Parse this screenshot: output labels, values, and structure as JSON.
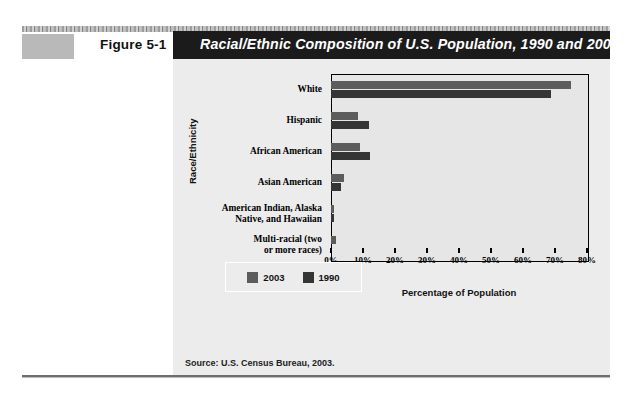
{
  "figure": {
    "label": "Figure 5-1",
    "title": "Racial/Ethnic Composition of U.S. Population, 1990 and 2003",
    "source": "Source: U.S. Census Bureau, 2003."
  },
  "colors": {
    "title_bar_bg": "#1b1b1b",
    "title_text": "#ffffff",
    "panel_bg": "#ececec",
    "plot_bg": "#e6e6e6",
    "series_2003": "#5c5c5c",
    "series_1990": "#353535",
    "figure_swatch": "#b9b9b9"
  },
  "chart_data": {
    "type": "bar",
    "orientation": "horizontal",
    "title": "Racial/Ethnic Composition of U.S. Population, 1990 and 2003",
    "xlabel": "Percentage of Population",
    "ylabel": "Race/Ethnicity",
    "xlim": [
      0,
      80
    ],
    "xticks": [
      0,
      10,
      20,
      30,
      40,
      50,
      60,
      70,
      80
    ],
    "xtick_labels": [
      "0%",
      "10%",
      "20%",
      "30%",
      "40%",
      "50%",
      "60%",
      "70%",
      "80%"
    ],
    "grid": false,
    "legend_position": "bottom-center",
    "categories": [
      "White",
      "Hispanic",
      "African American",
      "Asian American",
      "American Indian, Alaska\nNative, and Hawaiian",
      "Multi-racial (two\nor more races)"
    ],
    "series": [
      {
        "name": "2003",
        "color": "#5c5c5c",
        "values": [
          75.1,
          8.5,
          9.0,
          4.0,
          1.0,
          1.5
        ]
      },
      {
        "name": "1990",
        "color": "#353535",
        "values": [
          68.8,
          12.0,
          12.3,
          3.0,
          1.0,
          0.0
        ]
      }
    ]
  },
  "legend": {
    "items": [
      {
        "label": "2003",
        "color": "#5c5c5c"
      },
      {
        "label": "1990",
        "color": "#353535"
      }
    ]
  }
}
